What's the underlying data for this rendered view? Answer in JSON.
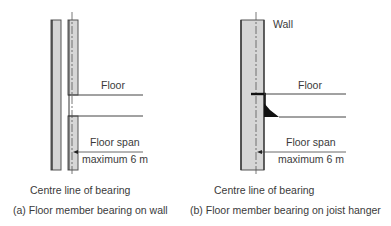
{
  "diagram_a": {
    "floor_label": "Floor",
    "span_label_line1": "Floor span",
    "span_label_line2": "maximum 6 m",
    "centre_line_label": "Centre line of bearing",
    "caption": "(a)  Floor member bearing on wall"
  },
  "diagram_b": {
    "wall_label": "Wall",
    "floor_label": "Floor",
    "span_label_line1": "Floor span",
    "span_label_line2": "maximum 6 m",
    "centre_line_label": "Centre line of bearing",
    "caption": "(b)  Floor member bearing on joist hanger"
  },
  "colors": {
    "wall_fill": "#d6d6d6",
    "line": "#444444",
    "hanger": "#111111"
  }
}
